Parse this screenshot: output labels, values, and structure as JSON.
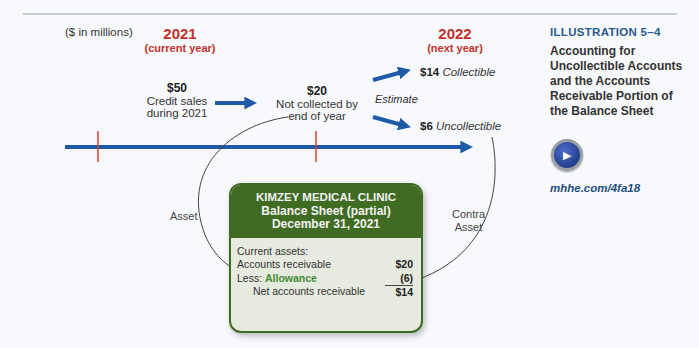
{
  "header": {
    "units": "($ in millions)",
    "current_year": {
      "year": "2021",
      "label": "(current year)"
    },
    "next_year": {
      "year": "2022",
      "label": "(next year)"
    }
  },
  "flow": {
    "credit_sales": {
      "amount": "$50",
      "line1": "Credit sales",
      "line2": "during 2021"
    },
    "not_collected": {
      "amount": "$20",
      "line1": "Not collected by",
      "line2": "end of year"
    },
    "estimate_label": "Estimate",
    "collectible": {
      "amount": "$14",
      "label": "Collectible"
    },
    "uncollectible": {
      "amount": "$6",
      "label": "Uncollectible"
    },
    "asset_label": "Asset",
    "contra_label_line1": "Contra",
    "contra_label_line2": "Asset"
  },
  "balance_sheet": {
    "company": "KIMZEY MEDICAL CLINIC",
    "title": "Balance Sheet (partial)",
    "date": "December 31, 2021",
    "section": "Current assets:",
    "rows": [
      {
        "label": "Accounts receivable",
        "value": "$20"
      },
      {
        "label_prefix": "Less: ",
        "label": "Allowance",
        "value": "(6)"
      },
      {
        "label": "Net accounts receivable",
        "value": "$14"
      }
    ]
  },
  "sidebar": {
    "illustration": "ILLUSTRATION 5–4",
    "title": "Accounting for Uncollectible Accounts and the Accounts Receivable Portion of the Balance Sheet",
    "icon": "video-icon",
    "link": "mhhe.com/4fa18"
  },
  "colors": {
    "year_red": "#c4312b",
    "arrow_blue": "#1f5aa6",
    "box_green": "#3f6b22",
    "allowance_green": "#3d8c31",
    "heading_blue": "#2a5a8c"
  }
}
